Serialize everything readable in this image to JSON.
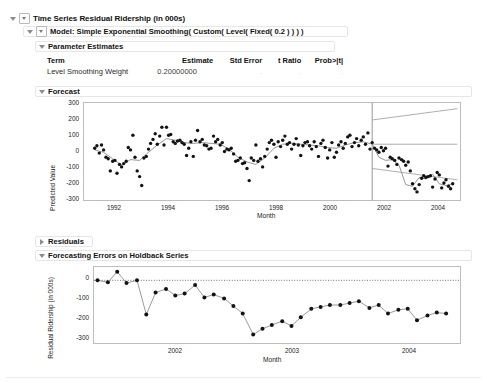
{
  "window": {
    "title": "Time Series Residual Ridership (in 000s)"
  },
  "outline": {
    "root_label": "Time Series Residual Ridership (in 000s)",
    "model_label": "Model: Simple Exponential Smoothing( Custom( Level( Fixed( 0.2 ) ) ) )",
    "parameter_estimates_label": "Parameter Estimates",
    "forecast_label": "Forecast",
    "residuals_label": "Residuals",
    "holdback_label": "Forecasting Errors on Holdback Series"
  },
  "parameter_estimates": {
    "columns": [
      "Term",
      "Estimate",
      "Std Error",
      "t Ratio",
      "Prob>|t|"
    ],
    "rows": [
      {
        "term": "Level Smoothing Weight",
        "estimate": "0.20000000",
        "std_error": ".",
        "t_ratio": ".",
        "prob_t": "."
      }
    ]
  },
  "chart_data": [
    {
      "id": "forecast",
      "type": "scatter",
      "title": "Forecast",
      "xlabel": "Month",
      "ylabel": "Predicted Value",
      "xlim": [
        1990.6,
        2004.6
      ],
      "ylim": [
        -300,
        300
      ],
      "xticks": [
        1992,
        1994,
        1996,
        1998,
        2000,
        2002,
        2004
      ],
      "yticks": [
        300,
        200,
        100,
        0,
        -100,
        -200,
        -300
      ],
      "grid": false,
      "forecast_start": 2001.33,
      "series": [
        {
          "name": "Observed",
          "kind": "points",
          "x": [
            1991.0,
            1991.08,
            1991.17,
            1991.25,
            1991.33,
            1991.42,
            1991.5,
            1991.58,
            1991.67,
            1991.75,
            1991.83,
            1991.92,
            1992.0,
            1992.08,
            1992.17,
            1992.25,
            1992.33,
            1992.42,
            1992.5,
            1992.58,
            1992.67,
            1992.75,
            1992.83,
            1992.92,
            1993.0,
            1993.08,
            1993.17,
            1993.25,
            1993.33,
            1993.42,
            1993.5,
            1993.58,
            1993.67,
            1993.75,
            1993.83,
            1993.92,
            1994.0,
            1994.08,
            1994.17,
            1994.25,
            1994.33,
            1994.42,
            1994.5,
            1994.58,
            1994.67,
            1994.75,
            1994.83,
            1994.92,
            1995.0,
            1995.08,
            1995.17,
            1995.25,
            1995.33,
            1995.42,
            1995.5,
            1995.58,
            1995.67,
            1995.75,
            1995.83,
            1995.92,
            1996.0,
            1996.08,
            1996.17,
            1996.25,
            1996.33,
            1996.42,
            1996.5,
            1996.58,
            1996.67,
            1996.75,
            1996.83,
            1996.92,
            1997.0,
            1997.08,
            1997.17,
            1997.25,
            1997.33,
            1997.42,
            1997.5,
            1997.58,
            1997.67,
            1997.75,
            1997.83,
            1997.92,
            1998.0,
            1998.08,
            1998.17,
            1998.25,
            1998.33,
            1998.42,
            1998.5,
            1998.58,
            1998.67,
            1998.75,
            1998.83,
            1998.92,
            1999.0,
            1999.08,
            1999.17,
            1999.25,
            1999.33,
            1999.42,
            1999.5,
            1999.58,
            1999.67,
            1999.75,
            1999.83,
            1999.92,
            2000.0,
            2000.08,
            2000.17,
            2000.25,
            2000.33,
            2000.42,
            2000.5,
            2000.58,
            2000.67,
            2000.75,
            2000.83,
            2000.92,
            2001.0,
            2001.08,
            2001.17,
            2001.25,
            2001.33,
            2001.42,
            2001.5,
            2001.58,
            2001.67,
            2001.75,
            2001.83,
            2001.92,
            2002.0,
            2002.08,
            2002.17,
            2002.25,
            2002.33,
            2002.42,
            2002.5,
            2002.58,
            2002.67,
            2002.75,
            2002.83,
            2002.92,
            2003.0,
            2003.08,
            2003.17,
            2003.25,
            2003.33,
            2003.42,
            2003.5,
            2003.58,
            2003.67,
            2003.75,
            2003.83,
            2003.92,
            2004.0,
            2004.08,
            2004.17,
            2004.25,
            2004.33
          ],
          "y": [
            20,
            35,
            -10,
            40,
            10,
            -35,
            -45,
            -120,
            -60,
            -55,
            -135,
            -80,
            -95,
            -75,
            -60,
            25,
            10,
            100,
            -35,
            -120,
            -155,
            -210,
            -40,
            -30,
            15,
            50,
            75,
            110,
            45,
            95,
            150,
            40,
            150,
            100,
            105,
            60,
            50,
            65,
            70,
            55,
            45,
            -25,
            20,
            60,
            -30,
            70,
            130,
            60,
            75,
            40,
            35,
            15,
            20,
            95,
            60,
            75,
            40,
            55,
            0,
            15,
            10,
            20,
            -15,
            -60,
            -55,
            -40,
            -75,
            -70,
            -105,
            -180,
            -40,
            -55,
            40,
            -60,
            -45,
            -95,
            -30,
            15,
            55,
            70,
            45,
            -35,
            60,
            30,
            70,
            95,
            45,
            55,
            15,
            45,
            80,
            40,
            -25,
            35,
            55,
            60,
            35,
            15,
            60,
            30,
            -30,
            50,
            70,
            25,
            -40,
            10,
            55,
            -35,
            -5,
            40,
            60,
            20,
            50,
            90,
            100,
            30,
            55,
            80,
            35,
            70,
            90,
            45,
            115,
            15,
            55,
            20,
            10,
            -5,
            25,
            5,
            20,
            -90,
            -35,
            -45,
            -55,
            -80,
            -40,
            -50,
            -60,
            -85,
            -65,
            -120,
            -200,
            -230,
            -250,
            -205,
            -165,
            -150,
            -160,
            -155,
            -150,
            -220,
            -170,
            -130,
            -145,
            -225,
            -195,
            -175,
            -215,
            -230,
            -200
          ]
        },
        {
          "name": "Smoothed / Model",
          "kind": "line",
          "x": [
            1991.0,
            1991.33,
            1991.67,
            1992.0,
            1992.33,
            1992.67,
            1993.0,
            1993.33,
            1993.67,
            1994.0,
            1994.33,
            1994.67,
            1995.0,
            1995.33,
            1995.67,
            1996.0,
            1996.33,
            1996.67,
            1997.0,
            1997.33,
            1997.67,
            1998.0,
            1998.33,
            1998.67,
            1999.0,
            1999.33,
            1999.67,
            2000.0,
            2000.33,
            2000.67,
            2001.0,
            2001.33
          ],
          "y": [
            10,
            -5,
            -45,
            -85,
            -50,
            -55,
            -5,
            40,
            80,
            70,
            55,
            50,
            55,
            50,
            45,
            15,
            -35,
            -65,
            -80,
            -40,
            20,
            45,
            50,
            45,
            40,
            35,
            25,
            20,
            40,
            55,
            60,
            45
          ]
        },
        {
          "name": "Holdback Actual",
          "kind": "line",
          "x": [
            2001.33,
            2001.58,
            2001.83,
            2002.08,
            2002.33,
            2002.58,
            2002.83,
            2003.08,
            2003.33,
            2003.58,
            2003.83,
            2004.08,
            2004.33
          ],
          "y": [
            45,
            -35,
            -55,
            -50,
            -85,
            -205,
            -215,
            -160,
            -170,
            -140,
            -200,
            -210,
            -200
          ]
        },
        {
          "name": "Forecast Mean",
          "kind": "line",
          "x": [
            2001.33,
            2004.5
          ],
          "y": [
            45,
            45
          ]
        },
        {
          "name": "Upper Confidence Limit",
          "kind": "line",
          "x": [
            2001.33,
            2004.5
          ],
          "y": [
            195,
            265
          ]
        },
        {
          "name": "Lower Confidence Limit",
          "kind": "line",
          "x": [
            2001.33,
            2004.5
          ],
          "y": [
            -105,
            -175
          ]
        }
      ]
    },
    {
      "id": "holdback-errors",
      "type": "line",
      "title": "Forecasting Errors on Holdback Series",
      "xlabel": "Month",
      "ylabel": "Residual Ridership (in 000s)",
      "xlim": [
        2001.3,
        2004.45
      ],
      "ylim": [
        -330,
        70
      ],
      "xticks": [
        2002,
        2003,
        2004
      ],
      "yticks": [
        0,
        -100,
        -200,
        -300
      ],
      "grid": false,
      "reference_line": 0,
      "x": [
        2001.33,
        2001.42,
        2001.5,
        2001.58,
        2001.67,
        2001.75,
        2001.83,
        2001.92,
        2002.0,
        2002.08,
        2002.17,
        2002.25,
        2002.33,
        2002.42,
        2002.5,
        2002.58,
        2002.67,
        2002.75,
        2002.83,
        2002.92,
        2003.0,
        2003.08,
        2003.17,
        2003.25,
        2003.33,
        2003.42,
        2003.5,
        2003.58,
        2003.67,
        2003.75,
        2003.83,
        2003.92,
        2004.0,
        2004.08,
        2004.17,
        2004.25,
        2004.33
      ],
      "y": [
        0,
        -10,
        45,
        -15,
        0,
        -180,
        -65,
        -45,
        -80,
        -70,
        -25,
        -90,
        -75,
        -95,
        -135,
        -175,
        -285,
        -255,
        -235,
        -215,
        -240,
        -195,
        -150,
        -140,
        -130,
        -130,
        -120,
        -110,
        -145,
        -130,
        -175,
        -155,
        -150,
        -210,
        -185,
        -170,
        -175
      ]
    }
  ]
}
